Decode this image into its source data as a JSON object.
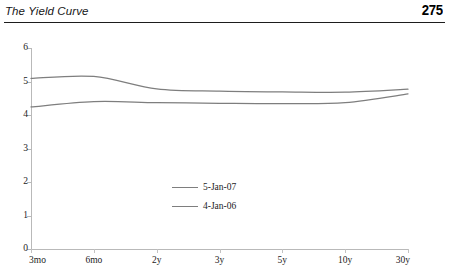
{
  "header": {
    "title": "The Yield Curve",
    "page_number": "275"
  },
  "chart_data": {
    "type": "line",
    "title": "",
    "xlabel": "",
    "ylabel": "",
    "categories": [
      "3mo",
      "6mo",
      "2y",
      "3y",
      "5y",
      "10y",
      "30y"
    ],
    "x_tick_labels": [
      "3mo",
      "6mo",
      "2y",
      "3y",
      "5y",
      "10y",
      "30y"
    ],
    "y_tick_labels": [
      "0",
      "1",
      "2",
      "3",
      "4",
      "5",
      "6"
    ],
    "ylim": [
      0,
      6
    ],
    "grid": false,
    "legend_position": "center",
    "series": [
      {
        "name": "5-Jan-07",
        "color": "#7e7e7e",
        "values": [
          5.09,
          5.15,
          4.78,
          4.71,
          4.69,
          4.68,
          4.77
        ]
      },
      {
        "name": "4-Jan-06",
        "color": "#7e7e7e",
        "values": [
          4.24,
          4.4,
          4.37,
          4.35,
          4.34,
          4.37,
          4.63
        ]
      }
    ]
  }
}
